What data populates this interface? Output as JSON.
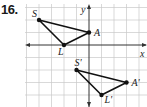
{
  "problem": {
    "number": "16."
  },
  "graph": {
    "origin_px": [
      89,
      45
    ],
    "unit_px": 12.5,
    "x_range": [
      -5,
      4
    ],
    "y_range": [
      -4,
      3
    ],
    "axis_labels": {
      "x": "x",
      "y": "y"
    },
    "grid_color": "#c8c8c8",
    "axis_color": "#333333",
    "line_color": "#111111"
  },
  "triangles": [
    {
      "name": "original",
      "vertices": [
        {
          "label": "S",
          "x": -4,
          "y": 2
        },
        {
          "label": "A",
          "x": 0,
          "y": 1
        },
        {
          "label": "L",
          "x": -2,
          "y": 0
        }
      ]
    },
    {
      "name": "image",
      "vertices": [
        {
          "label": "S'",
          "x": -1,
          "y": -2
        },
        {
          "label": "A'",
          "x": 3,
          "y": -3
        },
        {
          "label": "L'",
          "x": 1,
          "y": -4
        }
      ]
    }
  ]
}
